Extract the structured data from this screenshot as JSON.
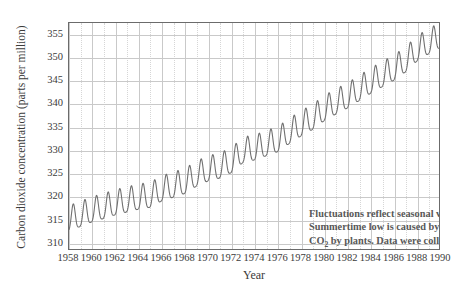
{
  "chart_data": {
    "type": "line",
    "title": "",
    "xlabel": "Year",
    "ylabel": "Carbon dioxide concentration (parts per million)",
    "xlim": [
      1958,
      1990
    ],
    "ylim": [
      308.5,
      357.5
    ],
    "xticks": [
      1958,
      1960,
      1962,
      1964,
      1966,
      1968,
      1970,
      1972,
      1974,
      1976,
      1978,
      1980,
      1982,
      1984,
      1986,
      1988,
      1990
    ],
    "yticks": [
      310,
      315,
      320,
      325,
      330,
      335,
      340,
      345,
      350,
      355
    ],
    "grid": true,
    "legend": "none",
    "series": [
      {
        "name": "Atmospheric CO2 (Mauna Loa)",
        "color": "#707070",
        "description": "Monthly mean CO2 concentration showing a rising trend with a regular seasonal oscillation of about 6 ppm peak-to-trough.",
        "annual_mean": [
          {
            "year": 1958,
            "value": 315.0
          },
          {
            "year": 1959,
            "value": 315.9
          },
          {
            "year": 1960,
            "value": 316.9
          },
          {
            "year": 1961,
            "value": 317.6
          },
          {
            "year": 1962,
            "value": 318.4
          },
          {
            "year": 1963,
            "value": 319.0
          },
          {
            "year": 1964,
            "value": 319.6
          },
          {
            "year": 1965,
            "value": 320.0
          },
          {
            "year": 1966,
            "value": 321.4
          },
          {
            "year": 1967,
            "value": 322.2
          },
          {
            "year": 1968,
            "value": 323.0
          },
          {
            "year": 1969,
            "value": 324.6
          },
          {
            "year": 1970,
            "value": 325.7
          },
          {
            "year": 1971,
            "value": 326.3
          },
          {
            "year": 1972,
            "value": 327.5
          },
          {
            "year": 1973,
            "value": 329.7
          },
          {
            "year": 1974,
            "value": 330.2
          },
          {
            "year": 1975,
            "value": 331.1
          },
          {
            "year": 1976,
            "value": 332.0
          },
          {
            "year": 1977,
            "value": 333.8
          },
          {
            "year": 1978,
            "value": 335.4
          },
          {
            "year": 1979,
            "value": 336.8
          },
          {
            "year": 1980,
            "value": 338.7
          },
          {
            "year": 1981,
            "value": 340.1
          },
          {
            "year": 1982,
            "value": 341.4
          },
          {
            "year": 1983,
            "value": 343.0
          },
          {
            "year": 1984,
            "value": 344.6
          },
          {
            "year": 1985,
            "value": 346.0
          },
          {
            "year": 1986,
            "value": 347.4
          },
          {
            "year": 1987,
            "value": 349.2
          },
          {
            "year": 1988,
            "value": 351.6
          },
          {
            "year": 1989,
            "value": 353.1
          },
          {
            "year": 1990,
            "value": 354.4
          }
        ],
        "seasonal_amplitude_ppm": 6.0,
        "seasonal_peak_month": "May",
        "seasonal_trough_month": "September"
      }
    ],
    "annotation": {
      "line1": "Fluctuations reflect seasonal variation.",
      "line2": "Summertime low is caused by uptake of",
      "line3_pre": "CO",
      "line3_sub": "2",
      "line3_post": " by plants.  Data were collected at",
      "line4": "the Mauna Loa Observatory in Hawaii."
    }
  },
  "colors": {
    "curve": "#707070",
    "frame": "#6b6b6b",
    "grid_major": "#c9c9c9",
    "grid_minor": "#d6d6d6",
    "text": "#3b3b3b",
    "annotation_text": "#585858",
    "background": "#ffffff"
  }
}
